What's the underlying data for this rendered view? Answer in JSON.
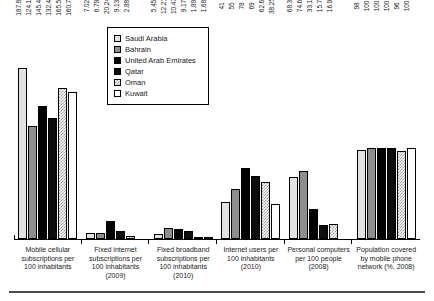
{
  "chart_data": {
    "type": "bar",
    "title": "",
    "subtitle": "",
    "xlabel": "",
    "ylabel": "",
    "grid": false,
    "legend_position": "top-center-inside",
    "ylim": [
      0,
      200
    ],
    "categories": [
      "Mobile cellular subscriptions per 100 inhabitants",
      "Fixed internet subscriptions per 100 inhabitants (2009)",
      "Fixed broadband subscriptions per 100 inhabitants (2010)",
      "Internet users per 100 inhabitants (2010)",
      "Personal computers per 100 people (2008)",
      "Population covered by mobile phone network (%, 2008)"
    ],
    "series": [
      {
        "name": "Saudi Arabia",
        "values": [
          187.86,
          7.02,
          5.45,
          41,
          68.3,
          98
        ]
      },
      {
        "name": "Bahrain",
        "values": [
          124.18,
          6.79,
          12.21,
          55,
          74.6,
          100
        ]
      },
      {
        "name": "United Arab Emirates",
        "values": [
          145.45,
          20.24,
          10.47,
          78,
          33.1,
          100
        ]
      },
      {
        "name": "Qatar",
        "values": [
          132.43,
          9.13,
          9.17,
          69,
          15.7,
          100
        ]
      },
      {
        "name": "Oman",
        "values": [
          165.54,
          2.88,
          1.89,
          62.6,
          16.9,
          96
        ]
      },
      {
        "name": "Kuwait",
        "values": [
          160.78,
          null,
          1.68,
          38.25,
          null,
          100
        ]
      }
    ],
    "value_labels": [
      [
        "187.86",
        "124.18",
        "145.45",
        "132.43",
        "165.54",
        "160.78"
      ],
      [
        "7.02",
        "6.79",
        "20.24",
        "9.13",
        "2.88",
        ""
      ],
      [
        "5.45",
        "12.21",
        "10.47",
        "9.17",
        "1.89",
        "1.68"
      ],
      [
        "41",
        "55",
        "78",
        "69",
        "62.6",
        "38.25"
      ],
      [
        "68.3",
        "74.6",
        "33.1",
        "15.7",
        "16.9",
        ""
      ],
      [
        "98",
        "100",
        "100",
        "100",
        "96",
        "100"
      ]
    ]
  },
  "legend": {
    "items": [
      {
        "label": "Saudi Arabia"
      },
      {
        "label": "Bahrain"
      },
      {
        "label": "United Arab Emirates"
      },
      {
        "label": "Qatar"
      },
      {
        "label": "Oman"
      },
      {
        "label": "Kuwait"
      }
    ]
  },
  "colors": {
    "saudi_arabia": "#e2e2e2",
    "bahrain": "#8e8e8e",
    "united_arab_emirates": "#000000",
    "qatar": "#0d0d0d",
    "oman": "#9a9a9a",
    "kuwait": "#ffffff",
    "axis": "#000000",
    "background": "#ffffff"
  }
}
